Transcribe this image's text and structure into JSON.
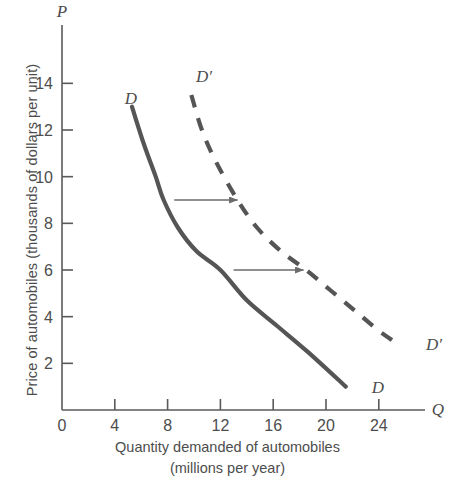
{
  "axes": {
    "y_axis_symbol": "P",
    "x_axis_symbol": "Q",
    "y_label": "Price of automobiles (thousands of dollars per unit)",
    "x_label_line1": "Quantity demanded of automobiles",
    "x_label_line2": "(millions per year)",
    "origin_label": "0",
    "axis_color": "#5a5a5a"
  },
  "labels": {
    "demand_top": "D",
    "demand_bottom": "D",
    "demand_shift_top": "D′",
    "demand_shift_bottom": "D′"
  },
  "chart_data": {
    "type": "line",
    "title": "",
    "xlabel": "Quantity demanded of automobiles (millions per year)",
    "ylabel": "Price of automobiles (thousands of dollars per unit)",
    "xlim": [
      0,
      27.5
    ],
    "ylim": [
      0,
      16.5
    ],
    "xticks": [
      0,
      4,
      8,
      12,
      16,
      20,
      24
    ],
    "yticks": [
      2,
      4,
      6,
      8,
      10,
      12,
      14
    ],
    "xtick_labels": [
      "0",
      "4",
      "8",
      "12",
      "16",
      "20",
      "24"
    ],
    "ytick_labels": [
      "2",
      "4",
      "6",
      "8",
      "10",
      "12",
      "14"
    ],
    "grid": false,
    "legend": "none",
    "series": [
      {
        "name": "D",
        "style": "solid",
        "color": "#555555",
        "label_start": "D",
        "label_end": "D",
        "points": [
          {
            "q": 5.3,
            "p": 13.0
          },
          {
            "q": 6.2,
            "p": 11.4
          },
          {
            "q": 7.1,
            "p": 10.0
          },
          {
            "q": 7.7,
            "p": 9.0
          },
          {
            "q": 8.8,
            "p": 7.8
          },
          {
            "q": 10.2,
            "p": 6.8
          },
          {
            "q": 12.0,
            "p": 6.0
          },
          {
            "q": 14.0,
            "p": 4.7
          },
          {
            "q": 16.3,
            "p": 3.6
          },
          {
            "q": 18.6,
            "p": 2.5
          },
          {
            "q": 21.5,
            "p": 1.0
          }
        ]
      },
      {
        "name": "D'",
        "style": "dashed",
        "color": "#555555",
        "label_start": "D′",
        "label_end": "D′",
        "points": [
          {
            "q": 9.8,
            "p": 13.5
          },
          {
            "q": 10.6,
            "p": 12.0
          },
          {
            "q": 11.7,
            "p": 10.6
          },
          {
            "q": 13.3,
            "p": 9.0
          },
          {
            "q": 14.8,
            "p": 7.8
          },
          {
            "q": 16.6,
            "p": 6.8
          },
          {
            "q": 18.5,
            "p": 6.0
          },
          {
            "q": 20.4,
            "p": 5.1
          },
          {
            "q": 22.3,
            "p": 4.2
          },
          {
            "q": 24.0,
            "p": 3.4
          },
          {
            "q": 25.0,
            "p": 3.0
          }
        ]
      }
    ],
    "annotations": [
      {
        "kind": "arrow",
        "name": "shift-arrow-upper",
        "p": 9.0,
        "q_start": 8.5,
        "q_end": 13.3
      },
      {
        "kind": "arrow",
        "name": "shift-arrow-lower",
        "p": 6.0,
        "q_start": 13.0,
        "q_end": 18.3
      }
    ]
  }
}
